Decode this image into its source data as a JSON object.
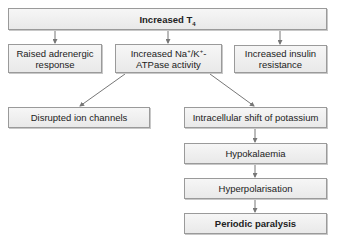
{
  "diagram": {
    "top": {
      "label": "Increased T",
      "sub": "4"
    },
    "level2": [
      {
        "label": "Raised adrenergic response"
      },
      {
        "pre": "Increased Na",
        "sup1": "+",
        "mid": "/K",
        "sup2": "+",
        "post": "-ATPase activity"
      },
      {
        "label": "Increased insulin resistance"
      }
    ],
    "left_branch": {
      "label": "Disrupted ion channels"
    },
    "right_chain": [
      {
        "label": "Intracellular shift of potassium"
      },
      {
        "label": "Hypokalaemia"
      },
      {
        "label": "Hyperpolarisation"
      },
      {
        "label": "Periodic paralysis"
      }
    ],
    "colors": {
      "box_fill": "#eeeeee",
      "box_border": "#9a9a9a",
      "arrow": "#777777"
    }
  }
}
